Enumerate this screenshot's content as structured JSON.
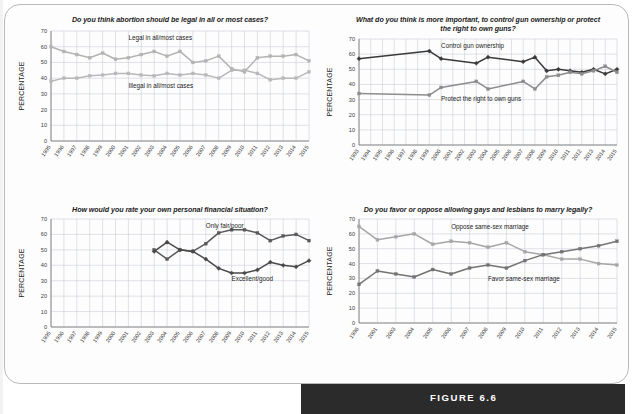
{
  "figure": {
    "caption_label": "FIGURE 6.6",
    "axis_title": "PERCENTAGE",
    "border_color": "#b9b9b9",
    "caption_band_color": "#2b2b2b"
  },
  "chart_data": [
    {
      "id": "abortion",
      "type": "line",
      "title": "Do you think abortion should be legal in all or most cases?",
      "xlabel": "",
      "ylabel": "PERCENTAGE",
      "ylim": [
        0,
        70
      ],
      "yticks": [
        0,
        10,
        20,
        30,
        40,
        50,
        60,
        70
      ],
      "grid": true,
      "legend_position": "inline-annotation",
      "categories": [
        "1995",
        "1996",
        "1997",
        "1998",
        "1999",
        "2000",
        "2001",
        "2002",
        "2003",
        "2004",
        "2005",
        "2006",
        "2007",
        "2008",
        "2009",
        "2010",
        "2011",
        "2012",
        "2013",
        "2014",
        "2015"
      ],
      "series": [
        {
          "name": "Legal in all/most cases",
          "color": "#b3b3b3",
          "marker": "square",
          "label_x_index": 6,
          "label_y": 64,
          "values": [
            60,
            57,
            55,
            53,
            56,
            52,
            53,
            55,
            57,
            54,
            57,
            50,
            51,
            54,
            46,
            44,
            53,
            54,
            54,
            55,
            51
          ]
        },
        {
          "name": "Illegal in all/most cases",
          "color": "#b8b8b8",
          "marker": "square",
          "label_x_index": 6,
          "label_y": 34,
          "values": [
            38,
            40,
            40,
            41.5,
            42,
            43,
            43,
            42,
            41.5,
            43,
            42,
            43,
            42,
            40,
            45,
            45,
            43,
            39,
            40,
            40,
            44
          ]
        }
      ]
    },
    {
      "id": "guns",
      "type": "line",
      "title": "What do you think is more important, to control gun ownership or protect the right to own guns?",
      "xlabel": "",
      "ylabel": "PERCENTAGE",
      "ylim": [
        0,
        70
      ],
      "yticks": [
        0,
        10,
        20,
        30,
        40,
        50,
        60,
        70
      ],
      "grid": true,
      "legend_position": "inline-annotation",
      "categories": [
        "1993",
        "1994",
        "1995",
        "1996",
        "1997",
        "1998",
        "1999",
        "2000",
        "2001",
        "2002",
        "2003",
        "2004",
        "2005",
        "2006",
        "2007",
        "2008",
        "2009",
        "2010",
        "2011",
        "2012",
        "2013",
        "2014",
        "2015"
      ],
      "series": [
        {
          "name": "Control gun ownership",
          "color": "#3a3a3a",
          "marker": "diamond",
          "label_x_index": 7,
          "label_y": 64,
          "values": [
            57,
            null,
            null,
            null,
            null,
            null,
            62,
            57,
            null,
            null,
            54,
            58,
            null,
            null,
            55,
            58,
            49,
            50,
            49,
            48,
            50,
            47,
            50
          ]
        },
        {
          "name": "Protect the right to own guns",
          "color": "#8c8c8c",
          "marker": "square",
          "label_x_index": 7,
          "label_y": 29,
          "values": [
            34,
            null,
            null,
            null,
            null,
            null,
            33,
            38,
            null,
            null,
            42,
            37,
            null,
            null,
            42,
            37,
            45,
            46,
            48,
            47,
            49,
            52,
            48
          ]
        }
      ]
    },
    {
      "id": "finances",
      "type": "line",
      "title": "How would you rate your own personal financial situation?",
      "xlabel": "",
      "ylabel": "PERCENTAGE",
      "ylim": [
        0,
        70
      ],
      "yticks": [
        0,
        10,
        20,
        30,
        40,
        50,
        60,
        70
      ],
      "grid": true,
      "legend_position": "inline-annotation",
      "categories": [
        "1995",
        "1996",
        "1997",
        "1998",
        "1999",
        "2000",
        "2001",
        "2002",
        "2003",
        "2004",
        "2005",
        "2006",
        "2007",
        "2008",
        "2009",
        "2010",
        "2011",
        "2012",
        "2013",
        "2014",
        "2015"
      ],
      "series": [
        {
          "name": "Only fair/poor",
          "color": "#595959",
          "marker": "square",
          "label_x_index": 12,
          "label_y": 64,
          "values": [
            null,
            null,
            null,
            null,
            null,
            null,
            null,
            null,
            50,
            44,
            50,
            49,
            54,
            61,
            63,
            63,
            61,
            56,
            59,
            60,
            56
          ]
        },
        {
          "name": "Excellent/good",
          "color": "#4a4a4a",
          "marker": "diamond",
          "label_x_index": 14,
          "label_y": 30,
          "values": [
            null,
            null,
            null,
            null,
            null,
            null,
            null,
            null,
            49,
            55,
            50,
            49,
            44,
            38,
            35,
            35,
            37,
            42,
            40,
            39,
            43
          ]
        }
      ]
    },
    {
      "id": "samesex",
      "type": "line",
      "title": "Do you favor or oppose allowing gays and lesbians to marry legally?",
      "xlabel": "",
      "ylabel": "PERCENTAGE",
      "ylim": [
        0,
        70
      ],
      "yticks": [
        0,
        10,
        20,
        30,
        40,
        50,
        60,
        70
      ],
      "grid": true,
      "legend_position": "inline-annotation",
      "categories": [
        "1996",
        "2001",
        "2003",
        "2004",
        "2005",
        "2006",
        "2007",
        "2008",
        "2009",
        "2010",
        "2011",
        "2012",
        "2013",
        "2014",
        "2015"
      ],
      "series": [
        {
          "name": "Oppose same-sex marriage",
          "color": "#a6a6a6",
          "marker": "square",
          "label_x_index": 5,
          "label_y": 63,
          "values": [
            65,
            56,
            58,
            60,
            53,
            55,
            54,
            51,
            54,
            48,
            46,
            43,
            43,
            40,
            39
          ]
        },
        {
          "name": "Favor same-sex marriage",
          "color": "#737373",
          "marker": "square",
          "label_x_index": 7,
          "label_y": 28,
          "values": [
            26,
            35,
            33,
            31,
            36,
            33,
            37,
            39,
            37,
            42,
            46,
            48,
            50,
            52,
            55
          ]
        }
      ]
    }
  ]
}
